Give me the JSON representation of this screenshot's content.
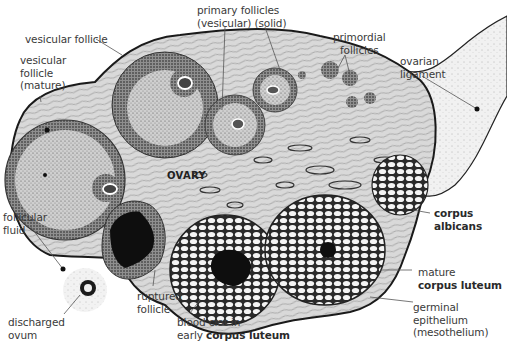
{
  "figure": {
    "organ_label": "OVARY",
    "colors": {
      "stroma": "#d6d6d6",
      "outline": "#1a1a1a",
      "blood_clot": "#111111",
      "ligament": "#e8e8e8",
      "text": "#3a3a3a"
    },
    "labels": {
      "vesicular_follicle": "vesicular follicle",
      "vesicular_mature_l1": "vesicular",
      "vesicular_mature_l2": "follicle",
      "vesicular_mature_l3": "(mature)",
      "primary_l1": "primary follicles",
      "primary_l2": "(vesicular) (solid)",
      "primordial_l1": "primordial",
      "primordial_l2": "follicles",
      "ligament_l1": "ovarian",
      "ligament_l2": "ligament",
      "follicular_fluid_l1": "follicular",
      "follicular_fluid_l2": "fluid",
      "corpus_albicans_l1": "corpus",
      "corpus_albicans_l2": "albicans",
      "mature_cl_l1": "mature",
      "mature_cl_l2": "corpus luteum",
      "germinal_l1": "germinal",
      "germinal_l2": "epithelium",
      "germinal_l3": "(mesothelium)",
      "ruptured_l1": "ruptured",
      "ruptured_l2": "follicle",
      "discharged_l1": "discharged",
      "discharged_l2": "ovum",
      "bloodclot_l1": "blood clot in",
      "bloodclot_l2_prefix": "early",
      "bloodclot_l2_bold": "corpus luteum"
    }
  }
}
